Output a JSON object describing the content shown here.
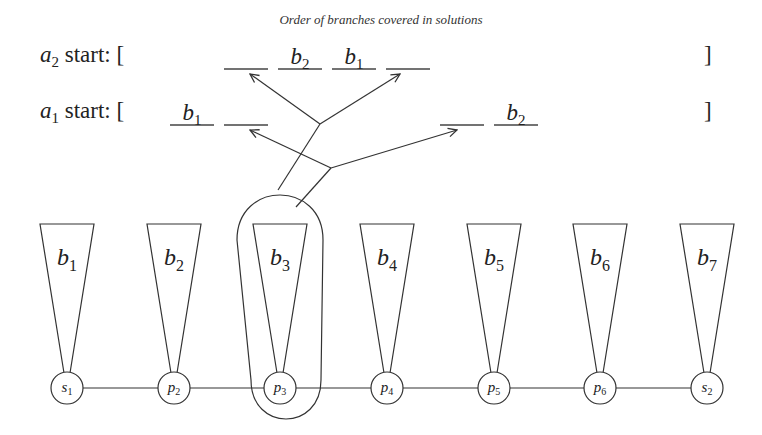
{
  "title": "Order of branches covered in solutions",
  "rows": [
    {
      "id": "a2",
      "var": "a",
      "sub": "2",
      "label": " start: [",
      "close": "]",
      "slots": [
        {
          "x": 224,
          "label": "",
          "sub": ""
        },
        {
          "x": 278,
          "label": "b",
          "sub": "2"
        },
        {
          "x": 332,
          "label": "b",
          "sub": "1"
        },
        {
          "x": 386,
          "label": "",
          "sub": ""
        }
      ]
    },
    {
      "id": "a1",
      "var": "a",
      "sub": "1",
      "label": " start: [",
      "close": "]",
      "slots": [
        {
          "x": 170,
          "label": "b",
          "sub": "1"
        },
        {
          "x": 224,
          "label": "",
          "sub": ""
        },
        {
          "x": 440,
          "label": "",
          "sub": ""
        },
        {
          "x": 494,
          "label": "b",
          "sub": "2"
        }
      ]
    }
  ],
  "branches": [
    {
      "label": "b",
      "sub": "1",
      "cx": 67
    },
    {
      "label": "b",
      "sub": "2",
      "cx": 174
    },
    {
      "label": "b",
      "sub": "3",
      "cx": 280
    },
    {
      "label": "b",
      "sub": "4",
      "cx": 387
    },
    {
      "label": "b",
      "sub": "5",
      "cx": 494
    },
    {
      "label": "b",
      "sub": "6",
      "cx": 600
    },
    {
      "label": "b",
      "sub": "7",
      "cx": 707
    }
  ],
  "nodes": [
    {
      "label": "s",
      "sub": "1",
      "cx": 67
    },
    {
      "label": "p",
      "sub": "2",
      "cx": 174
    },
    {
      "label": "p",
      "sub": "3",
      "cx": 280
    },
    {
      "label": "p",
      "sub": "4",
      "cx": 387
    },
    {
      "label": "p",
      "sub": "5",
      "cx": 494
    },
    {
      "label": "p",
      "sub": "6",
      "cx": 600
    },
    {
      "label": "s",
      "sub": "2",
      "cx": 707
    }
  ],
  "highlighted_branch": "b3",
  "colors": {
    "stroke": "#333333",
    "background": "#ffffff"
  }
}
